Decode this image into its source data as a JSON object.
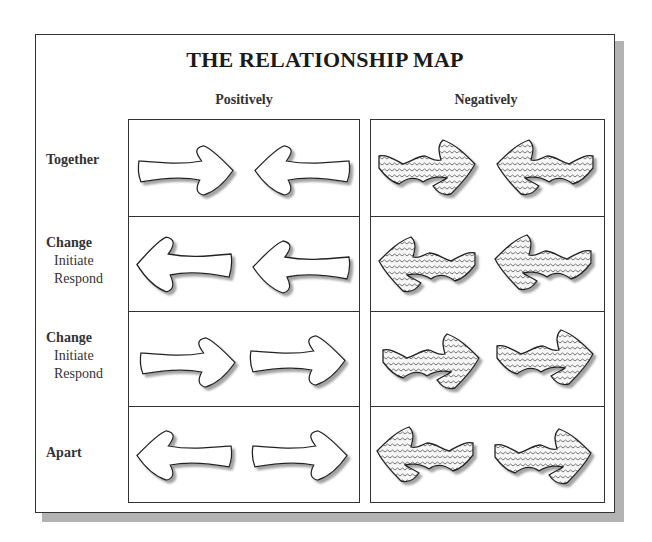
{
  "title": "THE RELATIONSHIP MAP",
  "columns": [
    {
      "label": "Positively"
    },
    {
      "label": "Negatively"
    }
  ],
  "rows": [
    {
      "label": "Together",
      "sub": [],
      "positive": "arrows converging (→ ←)",
      "negative": "wavy-patterned arrows converging"
    },
    {
      "label": "Change",
      "sub": [
        "Initiate",
        "Respond"
      ],
      "positive": "both arrows pointing left (← ←)",
      "negative": "wavy-patterned arrows pointing left"
    },
    {
      "label": "Change",
      "sub": [
        "Initiate",
        "Respond"
      ],
      "positive": "both arrows pointing right (→ →)",
      "negative": "wavy-patterned arrows pointing right"
    },
    {
      "label": "Apart",
      "sub": [],
      "positive": "arrows diverging (← →)",
      "negative": "wavy-patterned arrows diverging"
    }
  ],
  "colors": {
    "stroke": "#222222",
    "shadow": "#b3b3b3",
    "fill_positive": "#ffffff",
    "fill_negative_bg": "#f2f2f2"
  }
}
